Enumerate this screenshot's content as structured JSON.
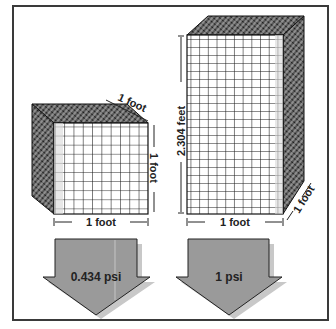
{
  "diagram": {
    "small_cube": {
      "width_label": "1 foot",
      "height_label": "1 foot",
      "depth_label": "1 foot"
    },
    "large_cube": {
      "width_label": "1 foot",
      "height_label": "2.304 feet",
      "depth_label": "1 foot"
    },
    "arrows": [
      {
        "label": "0.434 psi"
      },
      {
        "label": "1 psi"
      }
    ],
    "colors": {
      "border": "#3a3a3a",
      "grid_line": "#1a1a1a",
      "arrow_fill": "#9a9a9a",
      "arrow_shadow": "#c8c8c8",
      "text": "#222222"
    }
  }
}
